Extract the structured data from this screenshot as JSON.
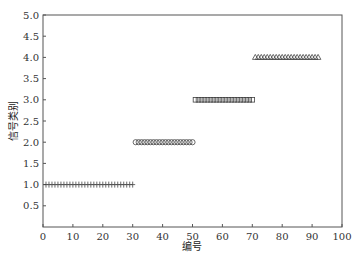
{
  "chart_data": {
    "type": "scatter",
    "title": "",
    "xlabel": "编号",
    "ylabel": "信号类别",
    "xlim": [
      0,
      100
    ],
    "ylim": [
      0,
      5
    ],
    "xticks": [
      0,
      10,
      20,
      30,
      40,
      50,
      60,
      70,
      80,
      90,
      100
    ],
    "yticks": [
      0.5,
      1.0,
      1.5,
      2.0,
      2.5,
      3.0,
      3.5,
      4.0,
      4.5,
      5.0
    ],
    "ytick_labels": [
      "0.5",
      "1.0",
      "1.5",
      "2.0",
      "2.5",
      "3.0",
      "3.5",
      "4.0",
      "4.5",
      "5.0"
    ],
    "grid": false,
    "legend": null,
    "series": [
      {
        "name": "类别1",
        "marker": "plus",
        "y": 1.0,
        "x_start": 1,
        "x_end": 30
      },
      {
        "name": "类别2",
        "marker": "circle",
        "y": 2.0,
        "x_start": 31,
        "x_end": 50
      },
      {
        "name": "类别3",
        "marker": "square",
        "y": 3.0,
        "x_start": 51,
        "x_end": 70
      },
      {
        "name": "类别4",
        "marker": "triangle",
        "y": 4.0,
        "x_start": 71,
        "x_end": 92
      }
    ],
    "colors": {
      "axis": "#555555",
      "marker": "#444444",
      "text": "#333333"
    }
  }
}
